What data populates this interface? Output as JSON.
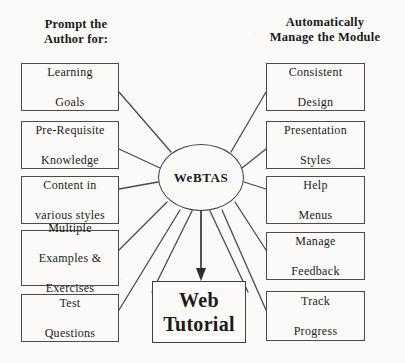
{
  "diagram": {
    "title_left": "Prompt the\nAuthor for:",
    "headers": {
      "left_line1": "Prompt the",
      "left_line2": "Author for:",
      "right_line1": "Automatically",
      "right_line2": "Manage the Module"
    },
    "hub": {
      "label": "WeBTAS"
    },
    "outcome": {
      "line1": "Web",
      "line2": "Tutorial"
    },
    "left_nodes": [
      {
        "line1": "Learning",
        "line2": "Goals",
        "line3": ""
      },
      {
        "line1": "Pre-Requisite",
        "line2": "Knowledge",
        "line3": ""
      },
      {
        "line1": "Content in",
        "line2": "various styles",
        "line3": ""
      },
      {
        "line1": "Multiple",
        "line2": "Examples &",
        "line3": "Exercises"
      },
      {
        "line1": "Test",
        "line2": "Questions",
        "line3": ""
      }
    ],
    "right_nodes": [
      {
        "line1": "Consistent",
        "line2": "Design",
        "line3": ""
      },
      {
        "line1": "Presentation",
        "line2": "Styles",
        "line3": ""
      },
      {
        "line1": "Help",
        "line2": "Menus",
        "line3": ""
      },
      {
        "line1": "Manage",
        "line2": "Feedback",
        "line3": ""
      },
      {
        "line1": "Track",
        "line2": "Progress",
        "line3": ""
      }
    ],
    "colors": {
      "background": "#fbfaf8",
      "ink": "#1a1a1a",
      "stroke": "#4a4a4a"
    }
  }
}
